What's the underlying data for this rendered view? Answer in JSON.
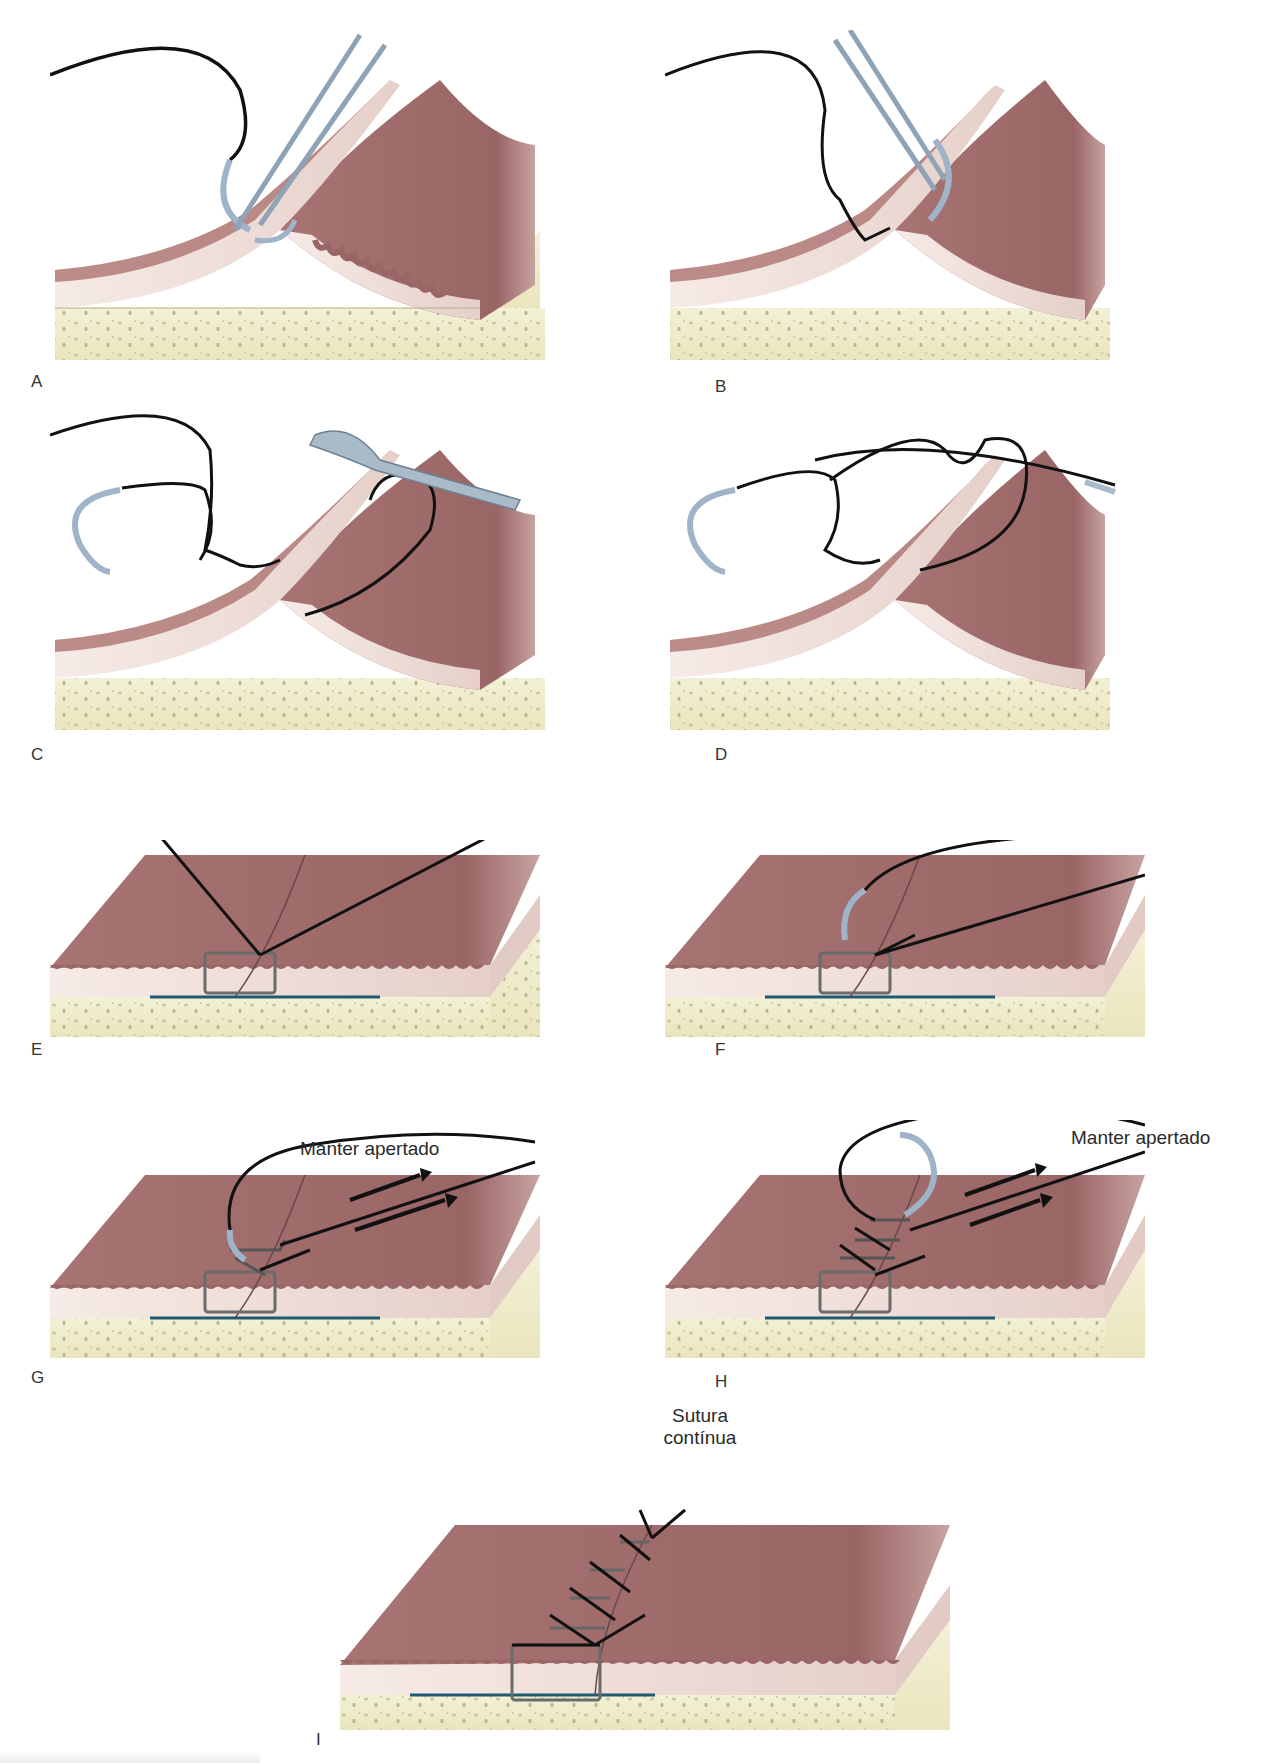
{
  "figure": {
    "panels": [
      {
        "id": "A",
        "label": "A",
        "type": "flap-needle-forceps"
      },
      {
        "id": "B",
        "label": "B",
        "type": "flap-needle-through"
      },
      {
        "id": "C",
        "label": "C",
        "type": "flap-needle-holder-loop"
      },
      {
        "id": "D",
        "label": "D",
        "type": "flap-thread-loops"
      },
      {
        "id": "E",
        "label": "E",
        "type": "block-initial-knot"
      },
      {
        "id": "F",
        "label": "F",
        "type": "block-needle-pass"
      },
      {
        "id": "G",
        "label": "G",
        "type": "block-keep-tight",
        "annotation": "Manter apertado"
      },
      {
        "id": "H",
        "label": "H",
        "type": "block-keep-tight-2",
        "annotation": "Manter apertado"
      },
      {
        "id": "I",
        "label": "I",
        "type": "block-continuous-suture",
        "annotation_line1": "Sutura",
        "annotation_line2": "contínua"
      }
    ],
    "colors": {
      "tissue_dark": "#9a6565",
      "tissue_light": "#ecd9d3",
      "bone": "#eeecc8",
      "bone_dots": "#c9c49a",
      "thread": "#111111",
      "needle": "#9fb4c8",
      "periosteum_line": "#1f5a72"
    }
  }
}
